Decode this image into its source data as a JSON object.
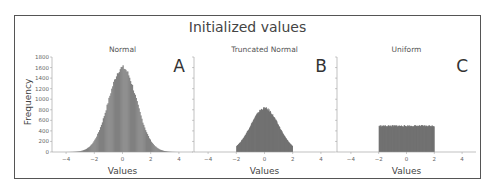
{
  "figure": {
    "title": "Initialized values"
  },
  "chart_data": [
    {
      "type": "bar",
      "title": "Normal",
      "panel_label": "A",
      "xlabel": "Values",
      "ylabel": "Frequency",
      "xlim": [
        -5,
        5
      ],
      "ylim": [
        0,
        1800
      ],
      "xticks": [
        -4,
        -2,
        0,
        2,
        4
      ],
      "yticks": [
        0,
        200,
        400,
        600,
        800,
        1000,
        1200,
        1400,
        1600,
        1800
      ],
      "distribution": "normal(0,1)",
      "peak_frequency": 1600,
      "range": [
        -4,
        4
      ],
      "color": "#808080"
    },
    {
      "type": "bar",
      "title": "Truncated Normal",
      "panel_label": "B",
      "xlabel": "Values",
      "xlim": [
        -5,
        5
      ],
      "ylim": [
        0,
        1800
      ],
      "xticks": [
        -4,
        -2,
        0,
        2,
        4
      ],
      "distribution": "truncated normal(0,1) on [-2,2]",
      "peak_frequency": 830,
      "range": [
        -2,
        2
      ],
      "color": "#666666"
    },
    {
      "type": "bar",
      "title": "Uniform",
      "panel_label": "C",
      "xlabel": "Values",
      "xlim": [
        -5,
        5
      ],
      "ylim": [
        0,
        1800
      ],
      "xticks": [
        -4,
        -2,
        0,
        2,
        4
      ],
      "distribution": "uniform(-2,2)",
      "peak_frequency": 500,
      "range": [
        -2,
        2
      ],
      "color": "#666666"
    }
  ],
  "panels": [
    {
      "title": "Normal",
      "letter": "A",
      "xlabel": "Values"
    },
    {
      "title": "Truncated Normal",
      "letter": "B",
      "xlabel": "Values"
    },
    {
      "title": "Uniform",
      "letter": "C",
      "xlabel": "Values"
    }
  ],
  "ylabel": "Frequency"
}
